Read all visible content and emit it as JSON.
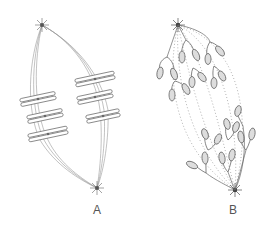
{
  "figure": {
    "panels": [
      {
        "id": "A",
        "label": "A",
        "stage": "metaphase",
        "chromosome_count": 6,
        "chromosome_shape": "paired chromatids aligned at equator"
      },
      {
        "id": "B",
        "label": "B",
        "stage": "anaphase",
        "chromosome_count": 12,
        "chromosome_shape": "V-shaped separating chromatids"
      }
    ],
    "colors": {
      "line": "#777777",
      "pole": "#555555",
      "background": "#ffffff"
    }
  }
}
